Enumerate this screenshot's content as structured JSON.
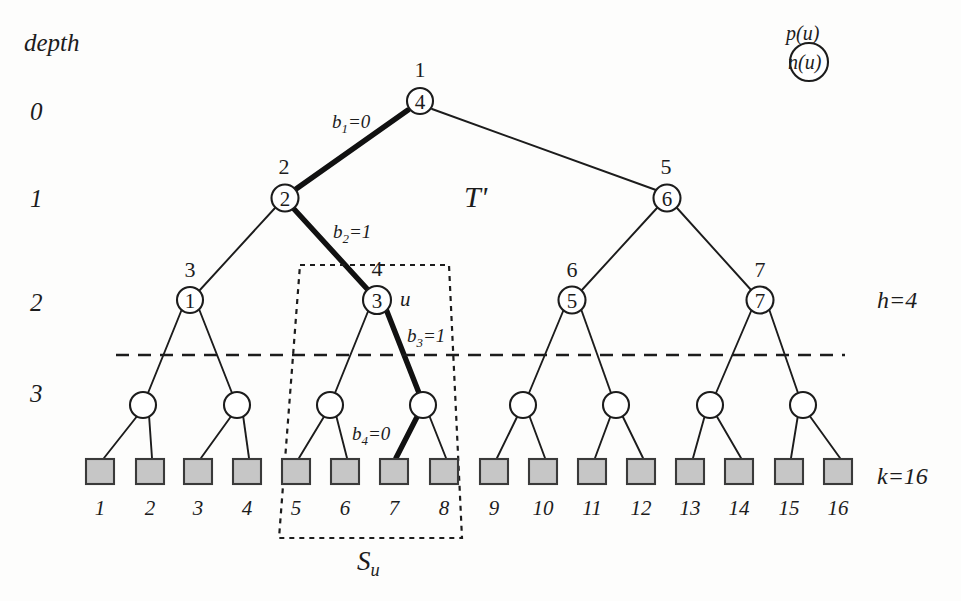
{
  "figure": {
    "tree_name": "T'",
    "depth_axis_title": "depth",
    "depth_levels": [
      "0",
      "1",
      "2",
      "3"
    ],
    "side_labels": {
      "height": "h=4",
      "leaves": "k=16"
    },
    "subtree_label": "S",
    "subtree_label_sub": "u",
    "node_u_label": "u",
    "legend": {
      "above": "p(u)",
      "inside": "n(u)"
    },
    "bit_labels": [
      {
        "name": "b1",
        "text": "b",
        "sub": "1",
        "value": "=0"
      },
      {
        "name": "b2",
        "text": "b",
        "sub": "2",
        "value": "=1"
      },
      {
        "name": "b3",
        "text": "b",
        "sub": "3",
        "value": "=1"
      },
      {
        "name": "b4",
        "text": "b",
        "sub": "4",
        "value": "=0"
      }
    ],
    "nodes": [
      {
        "id": "root",
        "depth": 0,
        "p": "1",
        "n": "4",
        "x": 420,
        "y": 101
      },
      {
        "id": "d1l",
        "depth": 1,
        "p": "2",
        "n": "2",
        "x": 285,
        "y": 198
      },
      {
        "id": "d1r",
        "depth": 1,
        "p": "5",
        "n": "6",
        "x": 667,
        "y": 198
      },
      {
        "id": "d2a",
        "depth": 2,
        "p": "3",
        "n": "1",
        "x": 190,
        "y": 300
      },
      {
        "id": "d2b",
        "depth": 2,
        "p": "4",
        "n": "3",
        "x": 377,
        "y": 300
      },
      {
        "id": "d2c",
        "depth": 2,
        "p": "6",
        "n": "5",
        "x": 572,
        "y": 300
      },
      {
        "id": "d2d",
        "depth": 2,
        "p": "7",
        "n": "7",
        "x": 760,
        "y": 300
      },
      {
        "id": "d3a",
        "depth": 3,
        "p": "",
        "n": "",
        "x": 143,
        "y": 405
      },
      {
        "id": "d3b",
        "depth": 3,
        "p": "",
        "n": "",
        "x": 237,
        "y": 405
      },
      {
        "id": "d3c",
        "depth": 3,
        "p": "",
        "n": "",
        "x": 330,
        "y": 405
      },
      {
        "id": "d3d",
        "depth": 3,
        "p": "",
        "n": "",
        "x": 423,
        "y": 405
      },
      {
        "id": "d3e",
        "depth": 3,
        "p": "",
        "n": "",
        "x": 523,
        "y": 405
      },
      {
        "id": "d3f",
        "depth": 3,
        "p": "",
        "n": "",
        "x": 616,
        "y": 405
      },
      {
        "id": "d3g",
        "depth": 3,
        "p": "",
        "n": "",
        "x": 710,
        "y": 405
      },
      {
        "id": "d3h",
        "depth": 3,
        "p": "",
        "n": "",
        "x": 803,
        "y": 405
      }
    ],
    "leaves": [
      {
        "num": "1",
        "x": 100
      },
      {
        "num": "2",
        "x": 150
      },
      {
        "num": "3",
        "x": 198
      },
      {
        "num": "4",
        "x": 247
      },
      {
        "num": "5",
        "x": 296
      },
      {
        "num": "6",
        "x": 345
      },
      {
        "num": "7",
        "x": 394
      },
      {
        "num": "8",
        "x": 444
      },
      {
        "num": "9",
        "x": 494
      },
      {
        "num": "10",
        "x": 543
      },
      {
        "num": "11",
        "x": 592
      },
      {
        "num": "12",
        "x": 641
      },
      {
        "num": "13",
        "x": 690
      },
      {
        "num": "14",
        "x": 739
      },
      {
        "num": "15",
        "x": 789
      },
      {
        "num": "16",
        "x": 838
      }
    ],
    "colors": {
      "ink": "#1c1c1c",
      "leaf_fill": "#c6c6c6",
      "leaf_stroke": "#3a3a3a",
      "background": "#fdfdfc"
    }
  }
}
